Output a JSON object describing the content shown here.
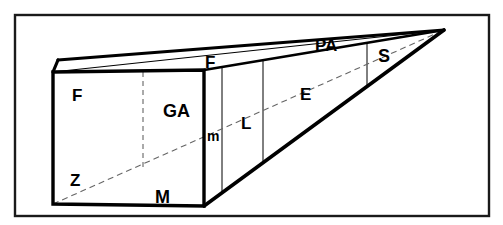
{
  "figure": {
    "type": "perspective-line-drawing",
    "background_color": "#ffffff",
    "ink_color": "#000000",
    "frame": {
      "name": "outer-border",
      "x": 15,
      "y": 15,
      "width": 474,
      "height": 201,
      "stroke_color": "#1a1a1a",
      "stroke_width": 2.4
    },
    "geometry": {
      "vanishing_point": {
        "x": 444,
        "y": 30
      },
      "front_face": {
        "top_left": {
          "x": 53,
          "y": 72
        },
        "top_right": {
          "x": 204,
          "y": 70
        },
        "bottom_right": {
          "x": 204,
          "y": 206
        },
        "bottom_left": {
          "x": 53,
          "y": 204
        }
      },
      "back_top_left": {
        "x": 58,
        "y": 60
      },
      "solid_stroke_width": 3.4,
      "thin_stroke_width": 1.0,
      "dashed_stroke_width": 1.0,
      "dash_pattern": "5 4",
      "thin_vertical_x": [
        222,
        263,
        367
      ],
      "interior_dashed_vertical_x": 143
    }
  },
  "labels": [
    {
      "id": "label-F-front",
      "text": "F",
      "x": 72,
      "y": 101,
      "size": 17
    },
    {
      "id": "label-F-top",
      "text": "F",
      "x": 205,
      "y": 68,
      "size": 17
    },
    {
      "id": "label-GA",
      "text": "GA",
      "x": 163,
      "y": 117,
      "size": 18
    },
    {
      "id": "label-Z",
      "text": "Z",
      "x": 70,
      "y": 186,
      "size": 17
    },
    {
      "id": "label-M",
      "text": "M",
      "x": 155,
      "y": 203,
      "size": 18
    },
    {
      "id": "label-m",
      "text": "m",
      "x": 207,
      "y": 141,
      "size": 14
    },
    {
      "id": "label-L",
      "text": "L",
      "x": 241,
      "y": 129,
      "size": 17
    },
    {
      "id": "label-E",
      "text": "E",
      "x": 300,
      "y": 100,
      "size": 17
    },
    {
      "id": "label-PA",
      "text": "PA",
      "x": 315,
      "y": 51,
      "size": 17
    },
    {
      "id": "label-S",
      "text": "S",
      "x": 378,
      "y": 62,
      "size": 18
    }
  ]
}
